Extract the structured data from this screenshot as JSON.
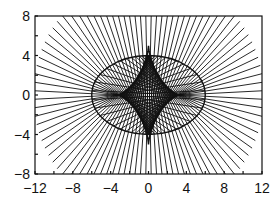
{
  "chart_data": {
    "type": "line",
    "title": "",
    "xlabel": "",
    "ylabel": "",
    "xlim": [
      -12,
      12
    ],
    "ylim": [
      -8,
      8
    ],
    "x_ticks": [
      -12,
      -8,
      -4,
      0,
      4,
      8,
      12
    ],
    "x_tick_labels": [
      "−12",
      "−8",
      "−4",
      "0",
      "4",
      "8",
      "12"
    ],
    "y_ticks": [
      -8,
      -4,
      0,
      4,
      8
    ],
    "y_tick_labels": [
      "−8",
      "−4",
      "0",
      "4",
      "8"
    ],
    "minor_tick_step": 2,
    "grid": false,
    "legend": null,
    "series": [
      {
        "name": "ellipse",
        "kind": "ellipse",
        "a": 6,
        "b": 4,
        "center": [
          0,
          0
        ]
      },
      {
        "name": "normal-lines",
        "kind": "normals",
        "count": 96,
        "outer_radius": 12.2
      },
      {
        "name": "evolute",
        "kind": "envelope",
        "cusps": [
          [
            3.33,
            0
          ],
          [
            -3.33,
            0
          ],
          [
            0,
            5
          ],
          [
            0,
            -5
          ]
        ]
      }
    ],
    "colors": {
      "line": "#111111",
      "background": "#ffffff"
    }
  }
}
